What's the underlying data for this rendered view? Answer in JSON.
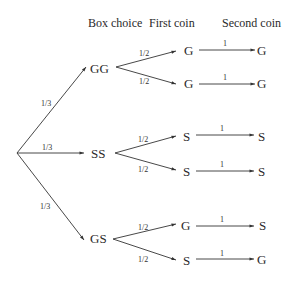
{
  "headers": {
    "box": "Box choice",
    "first": "First coin",
    "second": "Second coin"
  },
  "root_branches": [
    {
      "prob": "1/3",
      "box": "GG",
      "first": [
        {
          "prob": "1/2",
          "coin": "G",
          "second_prob": "1",
          "second": "G"
        },
        {
          "prob": "1/2",
          "coin": "G",
          "second_prob": "1",
          "second": "G"
        }
      ]
    },
    {
      "prob": "1/3",
      "box": "SS",
      "first": [
        {
          "prob": "1/2",
          "coin": "S",
          "second_prob": "1",
          "second": "S"
        },
        {
          "prob": "1/2",
          "coin": "S",
          "second_prob": "1",
          "second": "S"
        }
      ]
    },
    {
      "prob": "1/3",
      "box": "GS",
      "first": [
        {
          "prob": "1/2",
          "coin": "G",
          "second_prob": "1",
          "second": "S"
        },
        {
          "prob": "1/2",
          "coin": "S",
          "second_prob": "1",
          "second": "G"
        }
      ]
    }
  ],
  "colors": {
    "line": "#333333",
    "text": "#2a2a2a"
  }
}
